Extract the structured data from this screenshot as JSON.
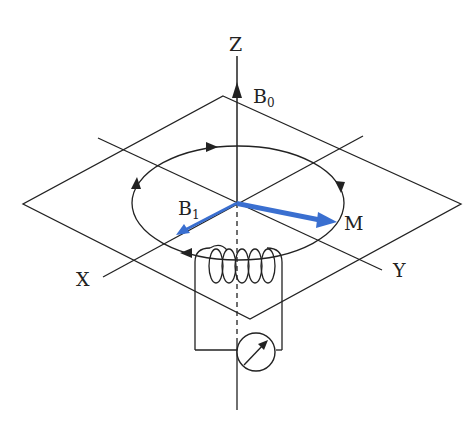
{
  "diagram": {
    "type": "nmr-precession-schematic",
    "labels": {
      "z_axis": "Z",
      "x_axis": "X",
      "y_axis": "Y",
      "b0": "B",
      "b0_sub": "0",
      "b1": "B",
      "b1_sub": "1",
      "magnetization": "M"
    },
    "colors": {
      "line": "#222222",
      "vector": "#3a6fd0",
      "background": "#ffffff"
    },
    "components": [
      "static field B0 along Z",
      "transverse XY plane",
      "precession circle with direction arrows",
      "RF field B1 vector",
      "magnetization vector M",
      "RF coil",
      "detector / meter"
    ]
  }
}
